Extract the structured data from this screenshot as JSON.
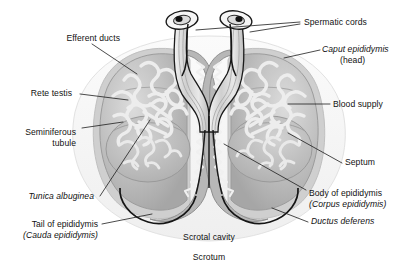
{
  "figure": {
    "background_color": "#ffffff",
    "line_color": "#1a1a1a",
    "tissue_fill": "#b9b9b9",
    "tubule_fill": "#e6e6e6",
    "scrotum_fill": "#f2f2f2"
  },
  "labels": {
    "efferent_ducts": "Efferent ducts",
    "rete_testis": "Rete testis",
    "seminiferous_tubule_line1": "Seminiferous",
    "seminiferous_tubule_line2": "tubule",
    "tunica_albuginea": "Tunica albuginea",
    "tail_of_epididymis_line1": "Tail of epididymis",
    "tail_of_epididymis_line2": "(Cauda epididymis)",
    "spermatic_cords": "Spermatic cords",
    "caput_epididymis_line1": "Caput epididymis",
    "caput_epididymis_line2": "(head)",
    "blood_supply": "Blood supply",
    "septum": "Septum",
    "body_of_epididymis_line1": "Body of epididymis",
    "body_of_epididymis_line2": "(Corpus epididymis)",
    "ductus_deferens": "Ductus deferens",
    "scrotal_cavity": "Scrotal cavity",
    "scrotum": "Scrotum"
  }
}
